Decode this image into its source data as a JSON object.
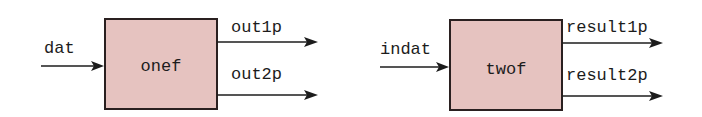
{
  "diagram": {
    "blocks": [
      {
        "name": "onef",
        "input": "dat",
        "outputs": [
          "out1p",
          "out2p"
        ]
      },
      {
        "name": "twof",
        "input": "indat",
        "outputs": [
          "result1p",
          "result2p"
        ]
      }
    ],
    "colors": {
      "box_fill": "#e6c3c0",
      "box_stroke": "#2a2020",
      "line": "#1c1c1c"
    }
  }
}
